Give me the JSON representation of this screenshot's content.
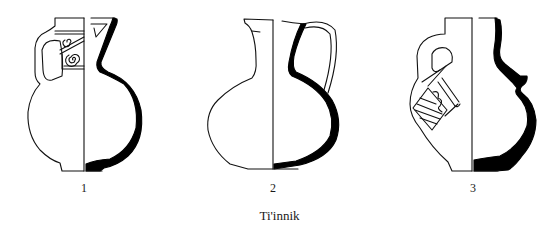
{
  "figure": {
    "caption": "Ti'innik",
    "colors": {
      "line": "#111111",
      "section_fill": "#000000",
      "background": "#ffffff"
    },
    "items": [
      {
        "number": "1",
        "description": "jug with decorated neck panel (spirals), profile section"
      },
      {
        "number": "2",
        "description": "jug with loop handle, profile section"
      },
      {
        "number": "3",
        "description": "jug with handle and hatched decoration, ridged shoulder, profile section"
      }
    ]
  }
}
